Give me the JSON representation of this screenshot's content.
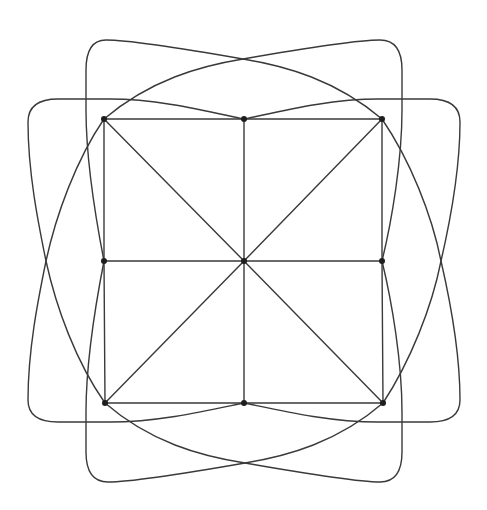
{
  "diagram": {
    "type": "graph-drawing",
    "colors": {
      "background": "#ffffff",
      "edge": "#3a3a3a",
      "vertex": "#1e1e1e"
    },
    "vertices": [
      {
        "id": "TL",
        "x": 104,
        "y": 119
      },
      {
        "id": "TM",
        "x": 244,
        "y": 119
      },
      {
        "id": "TR",
        "x": 382,
        "y": 119
      },
      {
        "id": "ML",
        "x": 104,
        "y": 261
      },
      {
        "id": "C",
        "x": 244,
        "y": 261
      },
      {
        "id": "MR",
        "x": 382,
        "y": 261
      },
      {
        "id": "BL",
        "x": 105,
        "y": 403
      },
      {
        "id": "BM",
        "x": 244,
        "y": 403
      },
      {
        "id": "BR",
        "x": 383,
        "y": 403
      }
    ],
    "straight_edges": [
      [
        "TL",
        "TM"
      ],
      [
        "TM",
        "TR"
      ],
      [
        "ML",
        "C"
      ],
      [
        "C",
        "MR"
      ],
      [
        "BL",
        "BM"
      ],
      [
        "BM",
        "BR"
      ],
      [
        "TL",
        "ML"
      ],
      [
        "ML",
        "BL"
      ],
      [
        "TM",
        "C"
      ],
      [
        "C",
        "BM"
      ],
      [
        "TR",
        "MR"
      ],
      [
        "MR",
        "BR"
      ],
      [
        "TL",
        "C"
      ],
      [
        "C",
        "BR"
      ],
      [
        "TR",
        "C"
      ],
      [
        "C",
        "BL"
      ]
    ],
    "curved_edges": [
      {
        "from": "TL",
        "to": "MR",
        "path": "M104,119 C150,80 200,66 243,59 C300,49 360,40 380,40 Q402,40 402,70 L402,110 C402,160 392,220 382,261"
      },
      {
        "from": "TR",
        "to": "ML",
        "path": "M382,119 C336,80 286,66 243,59 C186,49 126,40 106,40 Q86,40 86,70 L86,110 C86,160 96,220 104,261"
      },
      {
        "from": "BL",
        "to": "MR",
        "path": "M105,403 C150,442 200,456 245,463 C302,473 362,482 380,482 Q402,482 402,452 L402,412 C402,362 392,302 382,261"
      },
      {
        "from": "BR",
        "to": "ML",
        "path": "M383,403 C338,442 288,456 245,463 C188,473 128,482 108,482 Q86,482 86,452 L86,412 C86,362 96,302 104,261"
      },
      {
        "from": "TL",
        "to": "BM",
        "path": "M104,119 C76,160 56,215 46,261 C38,300 28,350 28,400 Q28,422 58,422 L110,422 C160,422 210,410 244,403"
      },
      {
        "from": "BL",
        "to": "TM",
        "path": "M105,403 C76,362 56,307 46,261 C38,222 28,172 28,122 Q28,99 58,99 L110,99 C160,99 210,112 244,119"
      },
      {
        "from": "TR",
        "to": "BM",
        "path": "M382,119 C410,160 432,215 441,261 C450,300 460,350 460,400 Q460,422 430,422 L378,422 C328,422 278,410 244,403"
      },
      {
        "from": "BR",
        "to": "TM",
        "path": "M383,403 C410,362 432,307 441,261 C450,222 460,172 460,122 Q460,99 430,99 L378,99 C328,99 278,112 244,119"
      }
    ],
    "crossings": [
      {
        "name": "top-x",
        "x": 243,
        "y": 59
      },
      {
        "name": "bottom-x",
        "x": 245,
        "y": 463
      },
      {
        "name": "left-x",
        "x": 46,
        "y": 261
      },
      {
        "name": "right-x",
        "x": 441,
        "y": 261
      }
    ]
  }
}
